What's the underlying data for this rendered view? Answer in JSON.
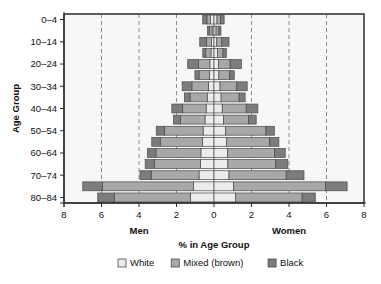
{
  "chart_data": {
    "type": "bar",
    "subtype": "population-pyramid",
    "title": "",
    "xlabel": "% in Age Group",
    "ylabel": "Age Group",
    "xlim": [
      -8,
      8
    ],
    "grid": true,
    "grid_style": "dashed vertical at 6,4,2 both sides",
    "legend_position": "bottom",
    "left_side_label": "Men",
    "right_side_label": "Women",
    "x_tick_labels": [
      "8",
      "6",
      "4",
      "2",
      "0",
      "2",
      "4",
      "6",
      "8"
    ],
    "x_tick_values": [
      -8,
      -6,
      -4,
      -2,
      0,
      2,
      4,
      6,
      8
    ],
    "y_tick_labels": [
      "80–84",
      "70–74",
      "60–64",
      "50–54",
      "40–44",
      "30–34",
      "20–24",
      "10–14",
      "0–4"
    ],
    "categories": [
      "0-4",
      "5-9",
      "10-14",
      "15-19",
      "20-24",
      "25-29",
      "30-34",
      "35-39",
      "40-44",
      "45-49",
      "50-54",
      "55-59",
      "60-64",
      "65-69",
      "70-74",
      "75-79",
      "80-84"
    ],
    "series": [
      {
        "name": "White",
        "color": "#ececec"
      },
      {
        "name": "Mixed (brown)",
        "color": "#a8a8a8"
      },
      {
        "name": "Black",
        "color": "#7c7c7c"
      }
    ],
    "men": {
      "white": [
        1.25,
        1.1,
        0.8,
        0.72,
        0.7,
        0.62,
        0.58,
        0.48,
        0.42,
        0.36,
        0.3,
        0.25,
        0.22,
        0.16,
        0.14,
        0.1,
        0.18
      ],
      "mixed": [
        4.05,
        4.85,
        2.55,
        2.45,
        2.4,
        2.25,
        2.05,
        1.3,
        1.25,
        0.92,
        0.88,
        0.55,
        0.6,
        0.28,
        0.26,
        0.14,
        0.2
      ],
      "black": [
        0.9,
        1.05,
        0.6,
        0.5,
        0.45,
        0.45,
        0.45,
        0.38,
        0.58,
        0.3,
        0.52,
        0.22,
        0.58,
        0.16,
        0.36,
        0.1,
        0.22
      ]
    },
    "women": {
      "white": [
        1.15,
        1.05,
        0.8,
        0.74,
        0.72,
        0.66,
        0.62,
        0.5,
        0.44,
        0.38,
        0.32,
        0.26,
        0.24,
        0.18,
        0.15,
        0.11,
        0.16
      ],
      "mixed": [
        3.55,
        4.9,
        3.05,
        2.55,
        2.5,
        2.3,
        2.15,
        1.35,
        1.28,
        0.96,
        0.9,
        0.58,
        0.62,
        0.3,
        0.27,
        0.15,
        0.18
      ],
      "black": [
        0.7,
        1.15,
        0.95,
        0.65,
        0.58,
        0.5,
        0.45,
        0.4,
        0.62,
        0.32,
        0.55,
        0.24,
        0.6,
        0.18,
        0.38,
        0.11,
        0.2
      ]
    },
    "legend": [
      {
        "label": "White",
        "color": "#ececec"
      },
      {
        "label": "Mixed (brown)",
        "color": "#a8a8a8"
      },
      {
        "label": "Black",
        "color": "#7c7c7c"
      }
    ]
  },
  "axes": {
    "x_title": "% in Age Group",
    "y_title": "Age Group",
    "men_label": "Men",
    "women_label": "Women"
  },
  "colors": {
    "white_swatch": "#ececec",
    "mixed_swatch": "#a8a8a8",
    "black_swatch": "#7c7c7c",
    "plot_background": "#f7f7f7",
    "frame": "#2a2a2a",
    "grid": "#8a8a8a"
  }
}
